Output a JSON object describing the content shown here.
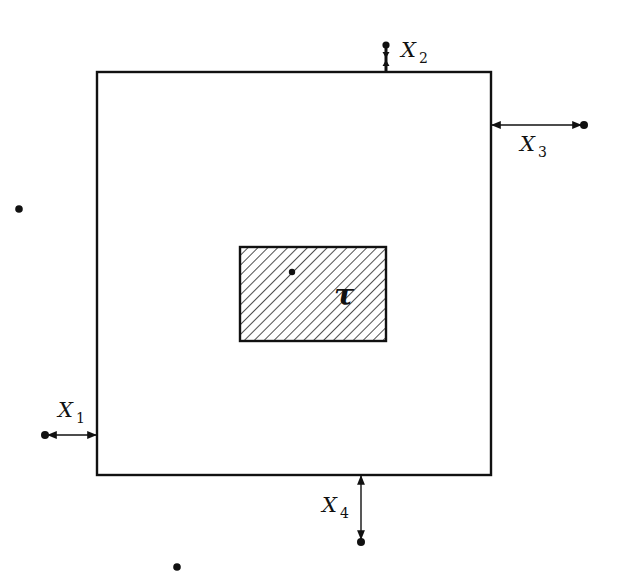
{
  "diagram": {
    "type": "region with boundary displacements",
    "colors": {
      "ink": "#111111",
      "background": "#ffffff"
    },
    "outer_region": {
      "x": 97,
      "y": 72,
      "width": 394,
      "height": 403
    },
    "inner_region": {
      "x": 240,
      "y": 247,
      "width": 146,
      "height": 94,
      "fill": "hatched",
      "label": "τ"
    },
    "inner_point": {
      "x": 292,
      "y": 272
    },
    "labels": {
      "x1": {
        "main": "X",
        "sub": "1"
      },
      "x2": {
        "main": "X",
        "sub": "2"
      },
      "x3": {
        "main": "X",
        "sub": "3"
      },
      "x4": {
        "main": "X",
        "sub": "4"
      }
    },
    "arrows": [
      {
        "id": "X1",
        "from": [
          45,
          435
        ],
        "to": [
          97,
          435
        ],
        "side": "left"
      },
      {
        "id": "X2",
        "from": [
          386,
          44
        ],
        "to": [
          386,
          72
        ],
        "side": "top"
      },
      {
        "id": "X3",
        "from": [
          491,
          125
        ],
        "to": [
          584,
          125
        ],
        "side": "right"
      },
      {
        "id": "X4",
        "from": [
          361,
          475
        ],
        "to": [
          361,
          542
        ],
        "side": "bottom"
      }
    ],
    "free_points": [
      {
        "x": 19,
        "y": 209
      },
      {
        "x": 177,
        "y": 567
      }
    ]
  }
}
